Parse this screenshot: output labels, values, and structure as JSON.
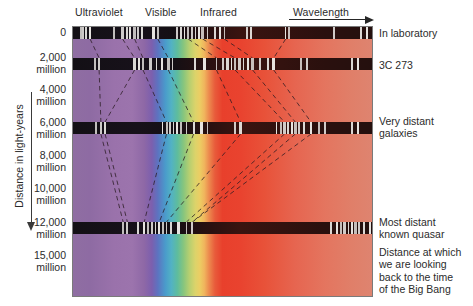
{
  "figure": {
    "type": "spectral-redshift-diagram"
  },
  "top_labels": [
    {
      "name": "ultraviolet",
      "text": "Ultraviolet",
      "x": 75
    },
    {
      "name": "visible",
      "text": "Visible",
      "x": 145
    },
    {
      "name": "infrared",
      "text": "Infrared",
      "x": 200
    },
    {
      "name": "wavelength",
      "text": "Wavelength",
      "x": 293
    }
  ],
  "y_axis": {
    "title": "Distance in light-years",
    "unit": "million",
    "ticks": [
      {
        "label": "0",
        "unit": "",
        "y": 32
      },
      {
        "label": "2,000",
        "unit": "million",
        "y": 57
      },
      {
        "label": "4,000",
        "unit": "million",
        "y": 89
      },
      {
        "label": "6,000",
        "unit": "million",
        "y": 122
      },
      {
        "label": "8,000",
        "unit": "million",
        "y": 155
      },
      {
        "label": "10,000",
        "unit": "million",
        "y": 188
      },
      {
        "label": "12,000",
        "unit": "million",
        "y": 222
      },
      {
        "label": "15,000",
        "unit": "million",
        "y": 255
      }
    ]
  },
  "annotations": [
    {
      "name": "in-laboratory",
      "lines": [
        "In laboratory"
      ],
      "y": 27
    },
    {
      "name": "3c-273",
      "lines": [
        "3C 273"
      ],
      "y": 59
    },
    {
      "name": "very-distant-galaxies",
      "lines": [
        "Very distant",
        "galaxies"
      ],
      "y": 115
    },
    {
      "name": "most-distant-quasar",
      "lines": [
        "Most distant",
        "known quasar"
      ],
      "y": 216
    },
    {
      "name": "big-bang-distance",
      "lines": [
        "Distance at which",
        "we are looking",
        "back to the time",
        "of the Big Bang"
      ],
      "y": 246
    }
  ],
  "chart_data": {
    "type": "heatmap",
    "xlabel": "Wavelength",
    "ylabel": "Distance in light-years",
    "ylim": [
      0,
      15000
    ],
    "yunit": "million light-years",
    "grid": false,
    "legend": "right-side annotations",
    "x_regions": [
      {
        "name": "Ultraviolet",
        "start_pct": 0,
        "end_pct": 27
      },
      {
        "name": "Visible",
        "start_pct": 27,
        "end_pct": 48
      },
      {
        "name": "Infrared",
        "start_pct": 48,
        "end_pct": 100
      }
    ],
    "colors": {
      "ultraviolet": "#9a72ab",
      "blue": "#4a9bcb",
      "green": "#5ebc9e",
      "yellow": "#dcd36a",
      "orange": "#f0b45d",
      "red": "#e8402c",
      "far_infrared": "#de8470",
      "band_dark": "#161214",
      "absorption_line": "#f2f0ec",
      "frame": "#7a7a7a",
      "text": "#2b2b2b"
    },
    "series": [
      {
        "name": "In laboratory",
        "distance_mly": 0,
        "redshift_offset_pct": 0,
        "y": 27,
        "height": 12,
        "line_positions_pct": [
          3.0,
          3.8,
          4.6,
          6.0,
          14.0,
          16.8,
          18.2,
          19.4,
          20.8,
          22.0,
          23.3,
          27.0,
          28.5,
          35.0,
          36.2,
          37.4,
          38.6,
          39.8,
          41.0,
          42.2,
          43.4,
          45.0,
          47.4,
          49.2,
          50.6,
          58.0,
          59.4,
          71.0,
          72.2,
          87.0,
          96.0,
          98.0
        ]
      },
      {
        "name": "3C 273",
        "distance_mly": 2000,
        "redshift_offset_pct": 6,
        "y": 58,
        "height": 12,
        "line_positions_pct": [
          7.6,
          9.0,
          20.8,
          22.2,
          23.6,
          26.0,
          28.0,
          30.0,
          32.0,
          33.4,
          41.0,
          44.0,
          48.0,
          50.2,
          51.6,
          53.0,
          54.2,
          55.6,
          57.0,
          58.4,
          60.0,
          62.4,
          65.0,
          67.0,
          76.0,
          78.0,
          93.0,
          95.0
        ]
      },
      {
        "name": "Very distant galaxies",
        "distance_mly": 6000,
        "redshift_offset_pct": 14,
        "y": 122,
        "height": 12,
        "line_positions_pct": [
          8.0,
          9.6,
          11.0,
          30.0,
          31.4,
          32.6,
          33.8,
          35.0,
          36.2,
          38.0,
          40.4,
          43.0,
          45.0,
          54.0,
          56.0,
          68.0,
          69.4,
          70.6,
          71.8,
          73.0,
          74.2,
          75.4,
          77.0,
          79.4,
          82.0,
          84.0,
          93.0,
          95.0
        ]
      },
      {
        "name": "Most distant known quasar",
        "distance_mly": 12000,
        "redshift_offset_pct": 30,
        "y": 222,
        "height": 12,
        "line_positions_pct": [
          17.0,
          18.4,
          22.0,
          24.0,
          25.4,
          26.6,
          27.8,
          29.0,
          30.2,
          31.4,
          33.0,
          35.4,
          38.0,
          40.0,
          86.0,
          88.0,
          89.4,
          90.6,
          91.8,
          93.0,
          94.2,
          95.4,
          97.0,
          99.0
        ]
      }
    ],
    "connectors": {
      "description": "dashed lines tracking each spectral line as it redshifts with distance",
      "style": "dashed",
      "count": 8
    }
  }
}
